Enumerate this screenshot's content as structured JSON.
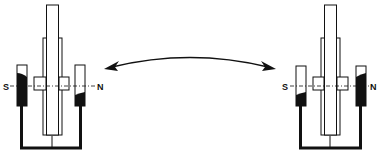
{
  "figure": {
    "left_apparatus": {
      "south_label": "S",
      "north_label": "N",
      "south_tube_fill": "high",
      "north_tube_fill": "low"
    },
    "right_apparatus": {
      "south_label": "S",
      "north_label": "N",
      "south_tube_fill": "low",
      "north_tube_fill": "high"
    },
    "arrow": "double-headed-curved",
    "caption": ""
  },
  "colors": {
    "ink": "#111111",
    "background": "#ffffff"
  }
}
